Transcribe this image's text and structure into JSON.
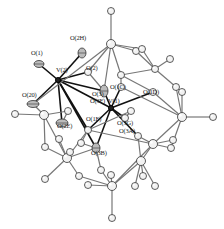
{
  "figure": {
    "type": "ORTEP molecular structure",
    "background": "#ffffff",
    "bond_color": "#777777",
    "vanadium_bond_color": "#111111",
    "atom_fill": "#f2f2f2",
    "atom_stroke": "#333333"
  },
  "labels": [
    {
      "id": "O1",
      "text": "O(1)",
      "x": 31,
      "y": 55
    },
    {
      "id": "O2H",
      "text": "O(2H)",
      "x": 70,
      "y": 40
    },
    {
      "id": "V2",
      "text": "V(2)",
      "x": 56,
      "y": 72
    },
    {
      "id": "O2",
      "text": "O(2)",
      "x": 86,
      "y": 70
    },
    {
      "id": "O20",
      "text": "O(20)",
      "x": 22,
      "y": 97
    },
    {
      "id": "O3",
      "text": "O(3)",
      "x": 92,
      "y": 96
    },
    {
      "id": "O3F",
      "text": "O(3F)",
      "x": 90,
      "y": 103
    },
    {
      "id": "V1",
      "text": "V(1)",
      "x": 108,
      "y": 103
    },
    {
      "id": "O1C",
      "text": "O(1C)",
      "x": 110,
      "y": 89
    },
    {
      "id": "O1D",
      "text": "O(1D)",
      "x": 143,
      "y": 94
    },
    {
      "id": "O2E",
      "text": "O(2E)",
      "x": 57,
      "y": 128
    },
    {
      "id": "O1E",
      "text": "O(1E)",
      "x": 86,
      "y": 121
    },
    {
      "id": "O3G",
      "text": "O(3G)",
      "x": 117,
      "y": 125
    },
    {
      "id": "O3A",
      "text": "O(3A)",
      "x": 119,
      "y": 133
    },
    {
      "id": "O3B",
      "text": "O(3B)",
      "x": 91,
      "y": 155
    }
  ],
  "atoms": [
    {
      "id": "V2",
      "x": 58,
      "y": 80,
      "r": 2.5,
      "kind": "V"
    },
    {
      "id": "V1",
      "x": 111,
      "y": 108,
      "r": 2.5,
      "kind": "V"
    },
    {
      "id": "O1",
      "x": 39,
      "y": 64,
      "rx": 5,
      "ry": 3.5,
      "kind": "O_aniso"
    },
    {
      "id": "O2H",
      "x": 82,
      "y": 53,
      "rx": 4,
      "ry": 5,
      "kind": "O_aniso"
    },
    {
      "id": "O20",
      "x": 33,
      "y": 104,
      "rx": 6,
      "ry": 3.5,
      "kind": "O_aniso"
    },
    {
      "id": "O2",
      "x": 88,
      "y": 72,
      "r": 3.5,
      "kind": "O"
    },
    {
      "id": "O3",
      "x": 104,
      "y": 91,
      "rx": 4,
      "ry": 6,
      "kind": "O_aniso"
    },
    {
      "id": "O1C",
      "x": 121,
      "y": 87,
      "r": 3.5,
      "kind": "O"
    },
    {
      "id": "O1D",
      "x": 153,
      "y": 92,
      "r": 3.5,
      "kind": "O"
    },
    {
      "id": "O2E",
      "x": 62,
      "y": 123,
      "rx": 6,
      "ry": 4,
      "kind": "O_aniso"
    },
    {
      "id": "O1E",
      "x": 88,
      "y": 130,
      "r": 3.5,
      "kind": "O"
    },
    {
      "id": "O3G",
      "x": 125,
      "y": 118,
      "r": 3.5,
      "kind": "O"
    },
    {
      "id": "O3A",
      "x": 138,
      "y": 136,
      "r": 3.5,
      "kind": "O"
    },
    {
      "id": "O3B",
      "x": 96,
      "y": 148,
      "rx": 4,
      "ry": 5,
      "kind": "O_aniso"
    },
    {
      "id": "a1",
      "x": 111,
      "y": 11,
      "r": 3.5
    },
    {
      "id": "a2",
      "x": 111,
      "y": 44,
      "r": 4.5
    },
    {
      "id": "a3",
      "x": 136,
      "y": 51,
      "r": 3.5
    },
    {
      "id": "a4",
      "x": 142,
      "y": 49,
      "r": 3.5
    },
    {
      "id": "a5",
      "x": 170,
      "y": 59,
      "r": 3.5
    },
    {
      "id": "a6",
      "x": 155,
      "y": 69,
      "r": 3.5
    },
    {
      "id": "a7",
      "x": 121,
      "y": 75,
      "r": 3.5
    },
    {
      "id": "a8",
      "x": 176,
      "y": 87,
      "r": 3.5
    },
    {
      "id": "a9",
      "x": 182,
      "y": 92,
      "r": 3.5
    },
    {
      "id": "a10",
      "x": 182,
      "y": 117,
      "r": 4.5
    },
    {
      "id": "a11",
      "x": 213,
      "y": 117,
      "r": 3.5
    },
    {
      "id": "a12",
      "x": 153,
      "y": 144,
      "r": 4.5
    },
    {
      "id": "a13",
      "x": 173,
      "y": 140,
      "r": 3.5
    },
    {
      "id": "a14",
      "x": 171,
      "y": 148,
      "r": 3.5
    },
    {
      "id": "a15",
      "x": 141,
      "y": 161,
      "r": 4.5
    },
    {
      "id": "a16",
      "x": 143,
      "y": 176,
      "r": 3.5
    },
    {
      "id": "a17",
      "x": 135,
      "y": 186,
      "r": 3.5
    },
    {
      "id": "a18",
      "x": 155,
      "y": 186,
      "r": 3.5
    },
    {
      "id": "a19",
      "x": 112,
      "y": 186,
      "r": 4.5
    },
    {
      "id": "a20",
      "x": 112,
      "y": 218,
      "r": 3.5
    },
    {
      "id": "a21",
      "x": 88,
      "y": 185,
      "r": 3.5
    },
    {
      "id": "a22",
      "x": 79,
      "y": 176,
      "r": 3.5
    },
    {
      "id": "a23",
      "x": 67,
      "y": 158,
      "r": 4.5
    },
    {
      "id": "a24",
      "x": 45,
      "y": 147,
      "r": 3.5
    },
    {
      "id": "a25",
      "x": 45,
      "y": 179,
      "r": 3.5
    },
    {
      "id": "a26",
      "x": 15,
      "y": 114,
      "r": 3.5
    },
    {
      "id": "a27",
      "x": 44,
      "y": 115,
      "r": 4.5
    },
    {
      "id": "a28",
      "x": 59,
      "y": 139,
      "r": 3.5
    },
    {
      "id": "a29",
      "x": 70,
      "y": 152,
      "r": 3.5
    },
    {
      "id": "a30",
      "x": 101,
      "y": 170,
      "r": 3.5
    },
    {
      "id": "a31",
      "x": 111,
      "y": 175,
      "r": 3.5
    },
    {
      "id": "a32",
      "x": 81,
      "y": 143,
      "r": 3.5
    },
    {
      "id": "a33",
      "x": 131,
      "y": 111,
      "r": 3.5
    },
    {
      "id": "a34",
      "x": 68,
      "y": 111,
      "r": 3.5
    }
  ],
  "bonds": [
    [
      "V2",
      "O1"
    ],
    [
      "V2",
      "O2H"
    ],
    [
      "V2",
      "O20"
    ],
    [
      "V2",
      "O2"
    ],
    [
      "V2",
      "O3"
    ],
    [
      "V2",
      "O2E"
    ],
    [
      "V2",
      "O1E"
    ],
    [
      "V2",
      "O3B"
    ],
    [
      "V2",
      "V1"
    ],
    [
      "V1",
      "O3"
    ],
    [
      "V1",
      "O1C"
    ],
    [
      "V1",
      "O3G"
    ],
    [
      "V1",
      "O3A"
    ],
    [
      "V1",
      "O1E"
    ],
    [
      "V1",
      "O1D"
    ],
    [
      "V1",
      "O3B"
    ],
    [
      "a1",
      "a2"
    ],
    [
      "a2",
      "a3"
    ],
    [
      "a2",
      "a4"
    ],
    [
      "a2",
      "a7"
    ],
    [
      "a2",
      "O2"
    ],
    [
      "a3",
      "a6"
    ],
    [
      "a4",
      "a6"
    ],
    [
      "a5",
      "a6"
    ],
    [
      "a6",
      "a7"
    ],
    [
      "a6",
      "a8"
    ],
    [
      "a2",
      "O20"
    ],
    [
      "a8",
      "a9"
    ],
    [
      "a9",
      "a10"
    ],
    [
      "a8",
      "a10"
    ],
    [
      "a10",
      "a11"
    ],
    [
      "a10",
      "O1D"
    ],
    [
      "a10",
      "a12"
    ],
    [
      "a10",
      "a14"
    ],
    [
      "a12",
      "a13"
    ],
    [
      "a12",
      "a14"
    ],
    [
      "a12",
      "a15"
    ],
    [
      "a12",
      "O3A"
    ],
    [
      "a15",
      "a16"
    ],
    [
      "a15",
      "a17"
    ],
    [
      "a15",
      "a18"
    ],
    [
      "a15",
      "a19"
    ],
    [
      "a15",
      "O3A"
    ],
    [
      "a19",
      "a20"
    ],
    [
      "a19",
      "a21"
    ],
    [
      "a19",
      "a22"
    ],
    [
      "a19",
      "a30"
    ],
    [
      "a19",
      "a31"
    ],
    [
      "a19",
      "a12"
    ],
    [
      "a23",
      "a24"
    ],
    [
      "a23",
      "a25"
    ],
    [
      "a23",
      "a22"
    ],
    [
      "a23",
      "a28"
    ],
    [
      "a23",
      "a29"
    ],
    [
      "a23",
      "a27"
    ],
    [
      "a23",
      "O1E"
    ],
    [
      "a23",
      "O3B"
    ],
    [
      "a27",
      "a26"
    ],
    [
      "a27",
      "O20"
    ],
    [
      "a27",
      "a34"
    ],
    [
      "a27",
      "a24"
    ],
    [
      "O1E",
      "a32"
    ],
    [
      "O1E",
      "a33"
    ],
    [
      "a33",
      "O3G"
    ],
    [
      "a7",
      "O1C"
    ],
    [
      "a7",
      "O1D"
    ],
    [
      "O2",
      "O3"
    ],
    [
      "a32",
      "O3B"
    ],
    [
      "a30",
      "O3B"
    ],
    [
      "O1C",
      "a10"
    ],
    [
      "O3",
      "a2"
    ],
    [
      "a34",
      "O2E"
    ],
    [
      "O1E",
      "a12"
    ]
  ]
}
